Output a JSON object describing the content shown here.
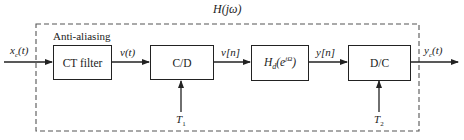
{
  "diagram": {
    "overall_system_label": "H(jω)",
    "group_label": "Anti-aliasing",
    "blocks": [
      {
        "id": "ct-filter",
        "label": "CT filter"
      },
      {
        "id": "c-to-d",
        "label": "C/D"
      },
      {
        "id": "discrete-system",
        "label_main": "H",
        "label_sub": "d",
        "label_arg": "(e",
        "label_sup": "jΩ",
        "label_close": ")"
      },
      {
        "id": "d-to-c",
        "label": "D/C"
      }
    ],
    "signals": {
      "input": {
        "main": "x",
        "sub": "c",
        "arg": "(t)"
      },
      "v_t": "v(t)",
      "v_n": "v[n]",
      "y_n": "y[n]",
      "output": {
        "main": "y",
        "sub": "c",
        "arg": "(t)"
      }
    },
    "sampling_periods": [
      {
        "main": "T",
        "sub": "1"
      },
      {
        "main": "T",
        "sub": "2"
      }
    ],
    "colors": {
      "line": "#222222",
      "dashed": "#555555"
    }
  }
}
